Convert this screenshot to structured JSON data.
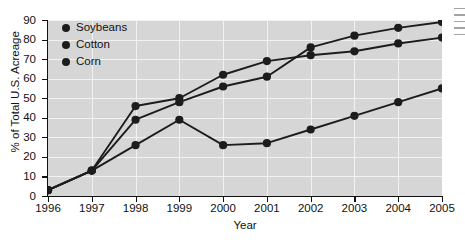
{
  "chart_data": {
    "type": "line",
    "title": "",
    "xlabel": "Year",
    "ylabel": "% of Total U.S. Acreage",
    "x": [
      1996,
      1997,
      1998,
      1999,
      2000,
      2001,
      2002,
      2003,
      2004,
      2005
    ],
    "xtick_labels": [
      "1996",
      "1997",
      "1998",
      "1999",
      "2000",
      "2001",
      "2002",
      "2003",
      "2004",
      "2005"
    ],
    "ytick_labels": [
      "0",
      "10",
      "20",
      "30",
      "40",
      "50",
      "60",
      "70",
      "80",
      "90"
    ],
    "yticks": [
      0,
      10,
      20,
      30,
      40,
      50,
      60,
      70,
      80,
      90
    ],
    "xlim": [
      1996,
      2005
    ],
    "ylim": [
      0,
      90
    ],
    "grid": true,
    "legend_position": "upper left",
    "series": [
      {
        "name": "Soybeans",
        "color": "#1c1c1c",
        "values": [
          3,
          13,
          39,
          48,
          56,
          61,
          76,
          82,
          86,
          89
        ]
      },
      {
        "name": "Cotton",
        "color": "#1c1c1c",
        "values": [
          3,
          13,
          46,
          50,
          62,
          69,
          72,
          74,
          78,
          81
        ]
      },
      {
        "name": "Corn",
        "color": "#1c1c1c",
        "values": [
          3,
          13,
          26,
          39,
          26,
          27,
          34,
          41,
          48,
          55
        ]
      }
    ]
  },
  "legend": {
    "items": [
      {
        "label": "Soybeans",
        "color": "#1c1c1c"
      },
      {
        "label": "Cotton",
        "color": "#1c1c1c"
      },
      {
        "label": "Corn",
        "color": "#1c1c1c"
      }
    ]
  },
  "style": {
    "plot_background": "#d6d6d6",
    "gridline_color": "#f2f2f2",
    "axis_color": "#111111",
    "page_background": "#ffffff"
  }
}
